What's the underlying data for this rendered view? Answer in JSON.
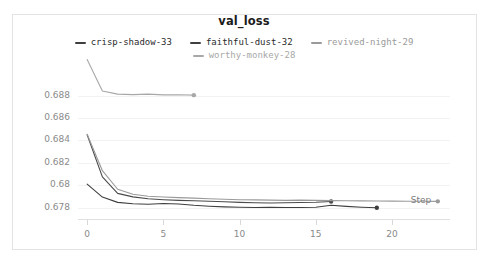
{
  "panel": {
    "border_color": "#e3e3e3",
    "background": "#ffffff"
  },
  "chart_data": {
    "type": "line",
    "title": "val_loss",
    "xlabel": "Step",
    "ylabel": "",
    "grid": true,
    "legend_position": "top-center",
    "xlim": [
      -0.6,
      23.8
    ],
    "ylim": [
      0.677,
      0.6892
    ],
    "xticks": [
      0,
      5,
      10,
      15,
      20
    ],
    "xtick_labels": [
      "0",
      "5",
      "10",
      "15",
      "20"
    ],
    "yticks": [
      0.688,
      0.686,
      0.684,
      0.682,
      0.68,
      0.678
    ],
    "ytick_labels": [
      "0.688",
      "0.686",
      "0.684",
      "0.682",
      "0.68",
      "0.678"
    ],
    "series": [
      {
        "name": "crisp-shadow-33",
        "color": "#4a4a4a",
        "endpoint_marker": true,
        "x": [
          0,
          1,
          2,
          3,
          4,
          5,
          6,
          7,
          8,
          9,
          10,
          11,
          12,
          13,
          14,
          15,
          16
        ],
        "values": [
          0.6845,
          0.68075,
          0.67928,
          0.67897,
          0.6788,
          0.67872,
          0.67866,
          0.67862,
          0.67858,
          0.67853,
          0.67848,
          0.67845,
          0.67843,
          0.67845,
          0.67847,
          0.67849,
          0.67856
        ]
      },
      {
        "name": "faithful-dust-32",
        "color": "#3f3f3f",
        "endpoint_marker": true,
        "x": [
          0,
          1,
          2,
          3,
          4,
          5,
          6,
          7,
          8,
          9,
          10,
          11,
          12,
          13,
          14,
          15,
          16,
          17,
          18,
          19
        ],
        "values": [
          0.6801,
          0.67895,
          0.67848,
          0.67836,
          0.67832,
          0.67838,
          0.67834,
          0.67822,
          0.67814,
          0.67808,
          0.67804,
          0.67802,
          0.67804,
          0.67802,
          0.67803,
          0.67805,
          0.67822,
          0.67812,
          0.67805,
          0.678
        ]
      },
      {
        "name": "revived-night-29",
        "color": "#9a9a9a",
        "endpoint_marker": true,
        "x": [
          0,
          1,
          2,
          3,
          4,
          5,
          6,
          7,
          8,
          9,
          10,
          11,
          12,
          13,
          14,
          15,
          16,
          17,
          18,
          19,
          20,
          21,
          22,
          23
        ],
        "values": [
          0.68455,
          0.6813,
          0.67965,
          0.6792,
          0.67903,
          0.67896,
          0.6789,
          0.67886,
          0.6788,
          0.67876,
          0.67872,
          0.6787,
          0.67868,
          0.67866,
          0.67868,
          0.67866,
          0.67864,
          0.67862,
          0.67861,
          0.6786,
          0.67859,
          0.67858,
          0.67858,
          0.67857
        ]
      },
      {
        "name": "worthy-monkey-28",
        "color": "#a8a8a8",
        "endpoint_marker": true,
        "x": [
          0,
          1,
          2,
          3,
          4,
          5,
          6,
          7
        ],
        "values": [
          0.6912,
          0.6884,
          0.68812,
          0.68808,
          0.68812,
          0.68805,
          0.68806,
          0.68803
        ]
      }
    ]
  },
  "legend": {
    "rows": [
      [
        {
          "label": "crisp-shadow-33",
          "color": "#3f3f3f",
          "text_color": "#2b2b2b"
        },
        {
          "label": "faithful-dust-32",
          "color": "#3f3f3f",
          "text_color": "#2b2b2b"
        },
        {
          "label": "revived-night-29",
          "color": "#9a9a9a",
          "text_color": "#9a9a9a"
        }
      ],
      [
        {
          "label": "worthy-monkey-28",
          "color": "#a8a8a8",
          "text_color": "#a8a8a8"
        }
      ]
    ]
  }
}
